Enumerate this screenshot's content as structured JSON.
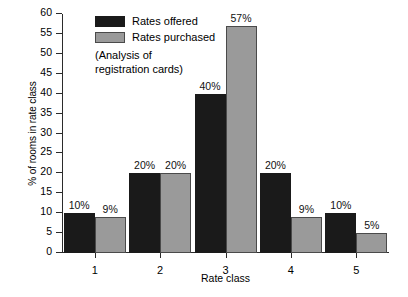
{
  "chart_data": {
    "type": "bar",
    "title": "",
    "xlabel": "Rate class",
    "ylabel": "% of rooms in rate class",
    "categories": [
      "1",
      "2",
      "3",
      "4",
      "5"
    ],
    "series": [
      {
        "name": "Rates offered",
        "color": "#1a1a1a",
        "values": [
          10,
          20,
          40,
          20,
          10
        ],
        "value_labels": [
          "10%",
          "20%",
          "40%",
          "20%",
          "10%"
        ]
      },
      {
        "name": "Rates purchased",
        "color": "#9a9a9a",
        "values": [
          9,
          20,
          57,
          9,
          5
        ],
        "value_labels": [
          "9%",
          "20%",
          "57%",
          "9%",
          "5%"
        ]
      }
    ],
    "ylim": [
      0,
      60
    ],
    "ytick_values": [
      0,
      5,
      10,
      15,
      20,
      25,
      30,
      35,
      40,
      45,
      50,
      55,
      60
    ],
    "ytick_labels": [
      "0",
      "5",
      "10",
      "15",
      "20",
      "25",
      "30",
      "35",
      "40",
      "45",
      "50",
      "55",
      "60"
    ],
    "grid": false,
    "legend_position": "top-left-inside",
    "annotations": [
      "(Analysis of",
      "registration cards)"
    ]
  }
}
